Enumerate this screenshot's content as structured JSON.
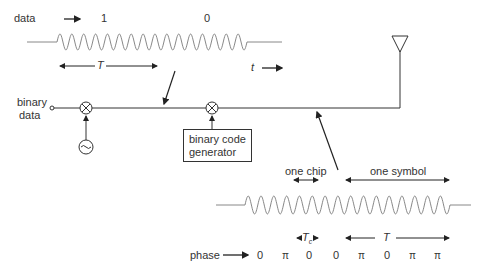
{
  "top_signal": {
    "data_label": "data",
    "bit1": "1",
    "bit0": "0",
    "period_label": "T",
    "time_label": "t"
  },
  "transmitter": {
    "input_label_line1": "binary",
    "input_label_line2": "data",
    "code_generator_line1": "binary code",
    "code_generator_line2": "generator",
    "oscillator_icon": "sine-oscillator",
    "mixer_icon": "multiplier"
  },
  "spread_signal": {
    "chip_label": "one chip",
    "symbol_label": "one symbol",
    "chip_period_label": "T",
    "chip_period_sub": "c",
    "symbol_period_label": "T",
    "phase_label": "phase",
    "phases": [
      "0",
      "π",
      "0",
      "0",
      "π",
      "0",
      "π",
      "π"
    ]
  }
}
